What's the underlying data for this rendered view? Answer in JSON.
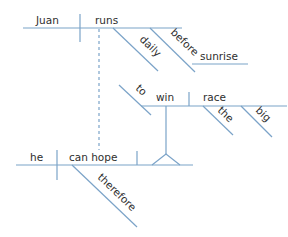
{
  "diagram": {
    "type": "sentence-diagram",
    "line_color": "#7ba3c8",
    "text_color": "#2e2e2e",
    "clause_main": {
      "subject": "Juan",
      "verb": "runs",
      "modifiers": [
        "daily",
        "before"
      ],
      "object_of_preposition": "sunrise"
    },
    "clause_sub": {
      "infinitive_marker": "to",
      "verb": "win",
      "object": "race",
      "object_modifiers": [
        "the",
        "big"
      ]
    },
    "clause_bottom": {
      "subject": "he",
      "verb": "can hope",
      "adverb": "therefore"
    }
  }
}
